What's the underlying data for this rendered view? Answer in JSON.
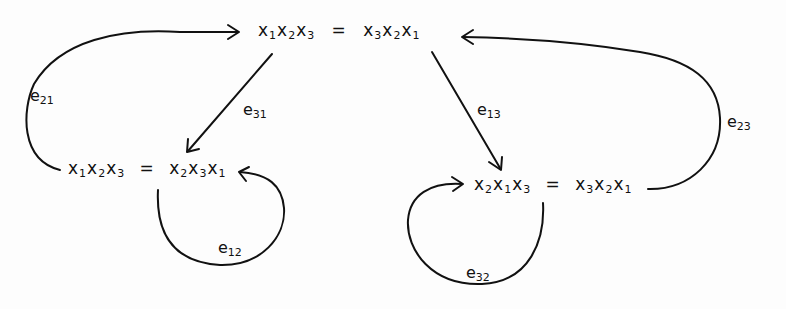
{
  "diagram": {
    "type": "state-transition-graph",
    "style": "hand-drawn",
    "stroke_color": "#111111",
    "background_color": "#fdfdfd",
    "nodes": [
      {
        "id": "top",
        "lhs": [
          {
            "v": "x",
            "i": "1"
          },
          {
            "v": "x",
            "i": "2"
          },
          {
            "v": "x",
            "i": "3"
          }
        ],
        "eq": "=",
        "rhs": [
          {
            "v": "x",
            "i": "3"
          },
          {
            "v": "x",
            "i": "2"
          },
          {
            "v": "x",
            "i": "1"
          }
        ],
        "text": "x1x2x3 = x3x2x1"
      },
      {
        "id": "left",
        "lhs": [
          {
            "v": "x",
            "i": "1"
          },
          {
            "v": "x",
            "i": "2"
          },
          {
            "v": "x",
            "i": "3"
          }
        ],
        "eq": "=",
        "rhs": [
          {
            "v": "x",
            "i": "2"
          },
          {
            "v": "x",
            "i": "3"
          },
          {
            "v": "x",
            "i": "1"
          }
        ],
        "text": "x1x2x3 = x2x3x1"
      },
      {
        "id": "right",
        "lhs": [
          {
            "v": "x",
            "i": "2"
          },
          {
            "v": "x",
            "i": "1"
          },
          {
            "v": "x",
            "i": "3"
          }
        ],
        "eq": "=",
        "rhs": [
          {
            "v": "x",
            "i": "3"
          },
          {
            "v": "x",
            "i": "2"
          },
          {
            "v": "x",
            "i": "1"
          }
        ],
        "text": "x2x1x3 = x3x2x1"
      }
    ],
    "edges": [
      {
        "id": "e21",
        "base": "e",
        "sub": "21",
        "from": "left",
        "to": "top"
      },
      {
        "id": "e31",
        "base": "e",
        "sub": "31",
        "from": "top",
        "to": "left"
      },
      {
        "id": "e12",
        "base": "e",
        "sub": "12",
        "from": "left",
        "to": "left"
      },
      {
        "id": "e13",
        "base": "e",
        "sub": "13",
        "from": "top",
        "to": "right"
      },
      {
        "id": "e23",
        "base": "e",
        "sub": "23",
        "from": "right",
        "to": "top"
      },
      {
        "id": "e32",
        "base": "e",
        "sub": "32",
        "from": "right",
        "to": "right"
      }
    ]
  }
}
